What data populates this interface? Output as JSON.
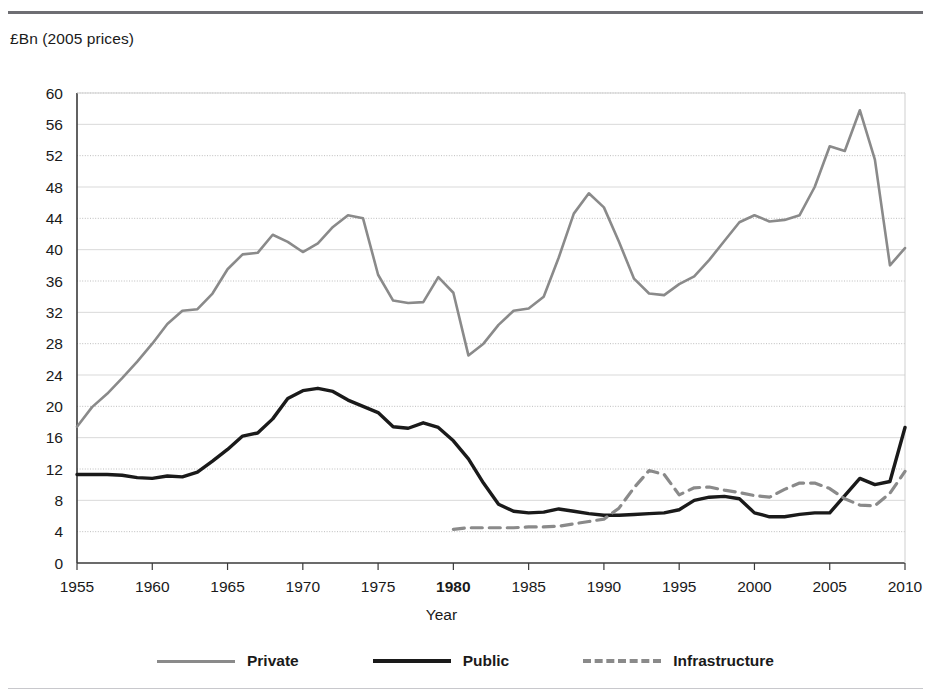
{
  "figure": {
    "unit_label": "£Bn (2005 prices)",
    "has_top_rule": true,
    "has_bottom_rule": true
  },
  "chart_data": {
    "type": "line",
    "title": "",
    "subtitle": "",
    "xlabel": "Year",
    "ylabel": "£Bn (2005 prices)",
    "xlim": [
      1955,
      2010
    ],
    "ylim": [
      0,
      60
    ],
    "yticks": [
      0,
      4,
      8,
      12,
      16,
      20,
      24,
      28,
      32,
      36,
      40,
      44,
      48,
      52,
      56,
      60
    ],
    "xticks": [
      1955,
      1960,
      1965,
      1970,
      1975,
      1980,
      1985,
      1990,
      1995,
      2000,
      2005,
      2010
    ],
    "xtick_labels": [
      "1955",
      "1960",
      "1965",
      "1970",
      "1975",
      "1980",
      "1985",
      "1990",
      "1995",
      "2000",
      "2005",
      "2010"
    ],
    "bold_xtick": "1980",
    "grid": true,
    "grid_style": "alternating solid / dotted horizontal",
    "legend_position": "bottom",
    "colors": {
      "private": "#8a8a8a",
      "public": "#1a1a1a",
      "infrastructure": "#8a8a8a",
      "grid_solid": "#d9d9d9",
      "grid_dotted": "#bdbdbd",
      "axis": "#3a3a3a"
    },
    "series": [
      {
        "name": "Private",
        "style": "solid",
        "color": "#8a8a8a",
        "x": [
          1955,
          1956,
          1957,
          1958,
          1959,
          1960,
          1961,
          1962,
          1963,
          1964,
          1965,
          1966,
          1967,
          1968,
          1969,
          1970,
          1971,
          1972,
          1973,
          1974,
          1975,
          1976,
          1977,
          1978,
          1979,
          1980,
          1981,
          1982,
          1983,
          1984,
          1985,
          1986,
          1987,
          1988,
          1989,
          1990,
          1991,
          1992,
          1993,
          1994,
          1995,
          1996,
          1997,
          1998,
          1999,
          2000,
          2001,
          2002,
          2003,
          2004,
          2005,
          2006,
          2007,
          2008,
          2009,
          2010
        ],
        "values": [
          17.4,
          19.9,
          21.6,
          23.6,
          25.7,
          28.0,
          30.5,
          32.2,
          32.4,
          34.4,
          37.5,
          39.4,
          39.6,
          41.9,
          41.0,
          39.7,
          40.8,
          42.9,
          44.4,
          44.0,
          36.8,
          33.5,
          33.2,
          33.3,
          36.5,
          34.5,
          26.5,
          28.0,
          30.4,
          32.2,
          32.5,
          34.0,
          39.0,
          44.6,
          47.2,
          45.4,
          41.0,
          36.3,
          34.4,
          34.2,
          35.6,
          36.6,
          38.7,
          41.1,
          43.5,
          44.4,
          43.6,
          43.8,
          44.4,
          48.0,
          53.2,
          52.6,
          57.8,
          51.5,
          38.0,
          40.2
        ]
      },
      {
        "name": "Public",
        "style": "solid",
        "color": "#1a1a1a",
        "x": [
          1955,
          1956,
          1957,
          1958,
          1959,
          1960,
          1961,
          1962,
          1963,
          1964,
          1965,
          1966,
          1967,
          1968,
          1969,
          1970,
          1971,
          1972,
          1973,
          1974,
          1975,
          1976,
          1977,
          1978,
          1979,
          1980,
          1981,
          1982,
          1983,
          1984,
          1985,
          1986,
          1987,
          1988,
          1989,
          1990,
          1991,
          1992,
          1993,
          1994,
          1995,
          1996,
          1997,
          1998,
          1999,
          2000,
          2001,
          2002,
          2003,
          2004,
          2005,
          2006,
          2007,
          2008,
          2009,
          2010
        ],
        "values": [
          11.3,
          11.3,
          11.3,
          11.2,
          10.9,
          10.8,
          11.1,
          11.0,
          11.6,
          13.0,
          14.5,
          16.2,
          16.6,
          18.4,
          21.0,
          22.0,
          22.3,
          21.9,
          20.8,
          20.0,
          19.2,
          17.4,
          17.2,
          17.9,
          17.3,
          15.6,
          13.3,
          10.2,
          7.5,
          6.6,
          6.4,
          6.5,
          6.9,
          6.6,
          6.3,
          6.1,
          6.1,
          6.2,
          6.3,
          6.4,
          6.8,
          8.0,
          8.4,
          8.5,
          8.2,
          6.4,
          5.9,
          5.9,
          6.2,
          6.4,
          6.4,
          8.6,
          10.8,
          10.0,
          10.4,
          17.3
        ]
      },
      {
        "name": "Infrastructure",
        "style": "dashed",
        "color": "#8a8a8a",
        "x": [
          1980,
          1981,
          1982,
          1983,
          1984,
          1985,
          1986,
          1987,
          1988,
          1989,
          1990,
          1991,
          1992,
          1993,
          1994,
          1995,
          1996,
          1997,
          1998,
          1999,
          2000,
          2001,
          2002,
          2003,
          2004,
          2005,
          2006,
          2007,
          2008,
          2009,
          2010
        ],
        "values": [
          4.3,
          4.5,
          4.5,
          4.5,
          4.5,
          4.6,
          4.6,
          4.7,
          5.0,
          5.3,
          5.6,
          7.0,
          9.6,
          11.8,
          11.3,
          8.7,
          9.6,
          9.7,
          9.3,
          9.0,
          8.6,
          8.4,
          9.4,
          10.2,
          10.2,
          9.5,
          8.2,
          7.4,
          7.3,
          8.9,
          11.7
        ]
      }
    ]
  },
  "legend": {
    "items": [
      {
        "label": "Private",
        "key": "private"
      },
      {
        "label": "Public",
        "key": "public"
      },
      {
        "label": "Infrastructure",
        "key": "infrastructure"
      }
    ]
  }
}
